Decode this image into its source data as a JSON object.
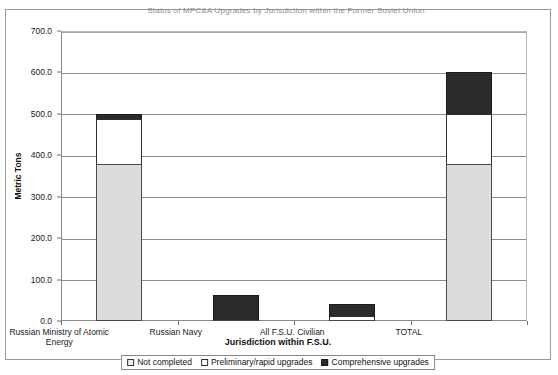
{
  "chart_data": {
    "type": "bar",
    "stacked": true,
    "title": "Status of MPC&A Upgrades by Jurisdiction within the Former Soviet Union",
    "xlabel": "Jurisdiction within F.S.U.",
    "ylabel": "Metric Tons",
    "ylim": [
      0,
      700
    ],
    "ytick_step": 100,
    "ytick_labels": [
      "0.0",
      "100.0",
      "200.0",
      "300.0",
      "400.0",
      "500.0",
      "600.0",
      "700.0"
    ],
    "ytick_values": [
      0,
      100,
      200,
      300,
      400,
      500,
      600,
      700
    ],
    "grid": true,
    "legend_position": "bottom",
    "categories": [
      "Russian Ministry of Atomic Energy",
      "Russian Navy",
      "All F.S.U. Civilian",
      "TOTAL"
    ],
    "category_lines": [
      [
        "Russian Ministry of Atomic",
        "Energy"
      ],
      [
        "Russian Navy"
      ],
      [
        "All F.S.U. Civilian"
      ],
      [
        "TOTAL"
      ]
    ],
    "series": [
      {
        "name": "Not completed",
        "color": "#dcdcdc",
        "values": [
          380,
          0,
          0,
          380
        ]
      },
      {
        "name": "Preliminary/rapid upgrades",
        "color": "#ffffff",
        "values": [
          108,
          0,
          12,
          120
        ]
      },
      {
        "name": "Comprehensive upgrades",
        "color": "#2b2b2b",
        "values": [
          12,
          62,
          28,
          100
        ]
      }
    ],
    "totals": [
      500,
      62,
      40,
      600
    ]
  },
  "legend": {
    "items": [
      {
        "label": "Not completed",
        "swatch": "notcompleted"
      },
      {
        "label": "Preliminary/rapid upgrades",
        "swatch": "preliminary"
      },
      {
        "label": "Comprehensive upgrades",
        "swatch": "comprehensive"
      }
    ]
  },
  "colors": {
    "not_completed": "#dcdcdc",
    "preliminary": "#ffffff",
    "comprehensive": "#2b2b2b",
    "frame": "#9a9a9a",
    "gridline": "#8c8c8c"
  }
}
